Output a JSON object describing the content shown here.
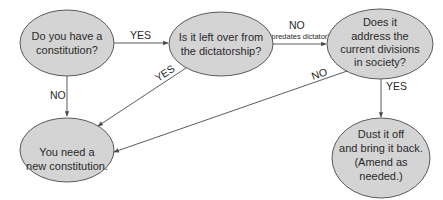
{
  "colors": {
    "node_fill": "#d4d4d4",
    "node_stroke": "#4a4a4a",
    "edge": "#4a4a4a",
    "text": "#2a2a2a",
    "background": "#ffffff"
  },
  "nodes": {
    "have_constitution": {
      "lines": [
        "Do you have a",
        "constitution?"
      ]
    },
    "left_over": {
      "lines": [
        "Is it left over from",
        "the dictatorship?"
      ]
    },
    "address_divisions": {
      "lines": [
        "Does it",
        "address the",
        "current divisions",
        "in society?"
      ]
    },
    "need_new": {
      "lines": [
        "You need a",
        "new constitution."
      ]
    },
    "dust_off": {
      "lines": [
        "Dust it off",
        "and bring it back.",
        "(Amend as",
        "needed.)"
      ]
    }
  },
  "edges": {
    "have_to_leftover": {
      "label": "YES"
    },
    "have_to_neednew": {
      "label": "NO"
    },
    "leftover_to_neednew": {
      "label": "YES"
    },
    "leftover_to_address": {
      "label": "NO",
      "sublabel": "(predates dictator)"
    },
    "address_to_neednew": {
      "label": "NO"
    },
    "address_to_dust": {
      "label": "YES"
    }
  }
}
